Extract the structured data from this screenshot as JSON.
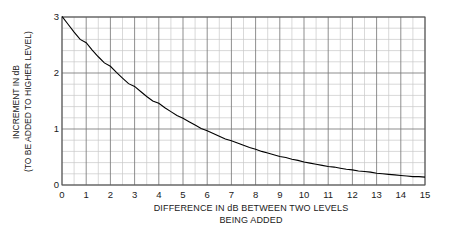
{
  "chart_data": {
    "type": "line",
    "title": "",
    "xlabel": "DIFFERENCE IN dB BETWEEN TWO LEVELS BEING ADDED",
    "xlabel_lines": [
      "DIFFERENCE IN dB BETWEEN TWO LEVELS",
      "BEING ADDED"
    ],
    "ylabel": "INCREMENT IN dB (TO BE ADDED TO HIGHER LEVEL)",
    "ylabel_lines": [
      "INCREMENT IN dB",
      "(TO BE ADDED TO HIGHER LEVEL)"
    ],
    "xlim": [
      0,
      15
    ],
    "ylim": [
      0,
      3
    ],
    "grid": true,
    "grid_major_x_step": 1,
    "grid_minor_x_step": 0.5,
    "grid_major_y_step": 1,
    "grid_minor_y_step": 0.2,
    "legend": null,
    "legend_position": "none",
    "line_color": "#000000",
    "grid_major_color": "#7a7a7a",
    "grid_minor_color": "#c8c8c8",
    "axis_color": "#555555",
    "background_color": "#ffffff",
    "xticks": [
      0,
      1,
      2,
      3,
      4,
      5,
      6,
      7,
      8,
      9,
      10,
      11,
      12,
      13,
      14,
      15
    ],
    "xticklabels": [
      "0",
      "1",
      "2",
      "3",
      "4",
      "5",
      "6",
      "7",
      "8",
      "9",
      "10",
      "11",
      "12",
      "13",
      "14",
      "15"
    ],
    "yticks": [
      0,
      1,
      2,
      3
    ],
    "yticklabels": [
      "0",
      "1",
      "2",
      "3"
    ],
    "series": [
      {
        "name": "increment",
        "formula": "10*log10(1 + 10^(-d/10))",
        "x": [
          0,
          0.25,
          0.5,
          0.75,
          1,
          1.25,
          1.5,
          1.75,
          2,
          2.25,
          2.5,
          2.75,
          3,
          3.25,
          3.5,
          3.75,
          4,
          4.25,
          4.5,
          4.75,
          5,
          5.25,
          5.5,
          5.75,
          6,
          6.25,
          6.5,
          6.75,
          7,
          7.25,
          7.5,
          7.75,
          8,
          8.25,
          8.5,
          8.75,
          9,
          9.25,
          9.5,
          9.75,
          10,
          10.25,
          10.5,
          10.75,
          11,
          11.25,
          11.5,
          11.75,
          12,
          12.25,
          12.5,
          12.75,
          13,
          13.25,
          13.5,
          13.75,
          14,
          14.25,
          14.5,
          14.75,
          15
        ],
        "y": [
          3.01,
          2.87,
          2.73,
          2.6,
          2.54,
          2.41,
          2.29,
          2.18,
          2.12,
          2.01,
          1.91,
          1.81,
          1.76,
          1.67,
          1.58,
          1.5,
          1.46,
          1.38,
          1.31,
          1.24,
          1.19,
          1.13,
          1.07,
          1.01,
          0.97,
          0.92,
          0.87,
          0.82,
          0.79,
          0.75,
          0.71,
          0.67,
          0.64,
          0.6,
          0.57,
          0.54,
          0.51,
          0.49,
          0.46,
          0.44,
          0.41,
          0.39,
          0.37,
          0.35,
          0.33,
          0.32,
          0.3,
          0.28,
          0.27,
          0.25,
          0.24,
          0.23,
          0.21,
          0.2,
          0.19,
          0.18,
          0.17,
          0.16,
          0.15,
          0.15,
          0.14
        ]
      }
    ]
  }
}
